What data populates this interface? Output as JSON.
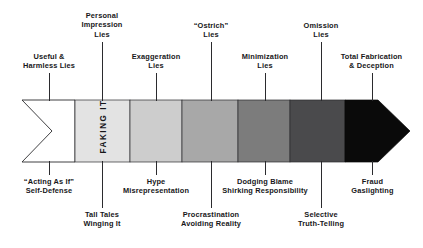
{
  "diagram": {
    "band_label": "FAKING IT",
    "colors": {
      "outline": "#2b2b2e",
      "text": "#17171a",
      "segment_1": "#ffffff",
      "segment_2": "#e3e3e3",
      "segment_3": "#cdcdcd",
      "segment_4": "#a8a8a8",
      "segment_5": "#7c7c7c",
      "segment_6": "#4a4a4c",
      "segment_7": "#2e2e30",
      "segment_8": "#0a0a0a"
    },
    "labels_above": [
      {
        "id": "useful-harmless-lies",
        "lines": [
          "Useful &",
          "Harmless Lies"
        ]
      },
      {
        "id": "personal-impression-lies",
        "lines": [
          "Personal",
          "Impression",
          "Lies"
        ]
      },
      {
        "id": "exaggeration-lies",
        "lines": [
          "Exaggeration",
          "Lies"
        ]
      },
      {
        "id": "ostrich-lies",
        "lines": [
          "“Ostrich”",
          "Lies"
        ]
      },
      {
        "id": "minimization-lies",
        "lines": [
          "Minimization",
          "Lies"
        ]
      },
      {
        "id": "omission-lies",
        "lines": [
          "Omission",
          "Lies"
        ]
      },
      {
        "id": "total-fabrication-deception",
        "lines": [
          "Total Fabrication",
          "& Deception"
        ]
      }
    ],
    "labels_below": [
      {
        "id": "acting-as-if-self-defense",
        "lines": [
          "“Acting As If”",
          "Self-Defense"
        ]
      },
      {
        "id": "tall-tales-winging-it",
        "lines": [
          "Tall Tales",
          "Winging It"
        ]
      },
      {
        "id": "hype-misrepresentation",
        "lines": [
          "Hype",
          "Misrepresentation"
        ]
      },
      {
        "id": "procrastination-avoiding-reality",
        "lines": [
          "Procrastination",
          "Avoiding Reality"
        ]
      },
      {
        "id": "dodging-blame-shirking-responsibility",
        "lines": [
          "Dodging Blame",
          "Shirking Responsibility"
        ]
      },
      {
        "id": "selective-truth-telling",
        "lines": [
          "Selective",
          "Truth-Telling"
        ]
      },
      {
        "id": "fraud-gaslighting",
        "lines": [
          "Fraud",
          "Gaslighting"
        ]
      }
    ]
  }
}
